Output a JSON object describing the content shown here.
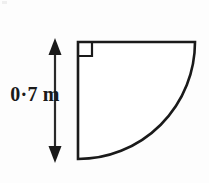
{
  "figure": {
    "background_color": "#fdfdfd",
    "stroke_color": "#1a1a1a",
    "fill_color": "#ffffff",
    "dimension_label": "0·7 m",
    "dimension_value": 0.7,
    "dimension_unit": "m",
    "right_angle_marker": "right-angle",
    "arrow_style": "double-headed",
    "shape": "quarter-circle",
    "geometry": {
      "vertex_x": 78,
      "vertex_y": 42,
      "radius_px": 117,
      "top_edge_end_x": 195,
      "bottom_edge_end_y": 159,
      "right_angle_size": 14,
      "arrow_x": 55,
      "arrow_top_y": 40,
      "arrow_bottom_y": 161
    }
  }
}
